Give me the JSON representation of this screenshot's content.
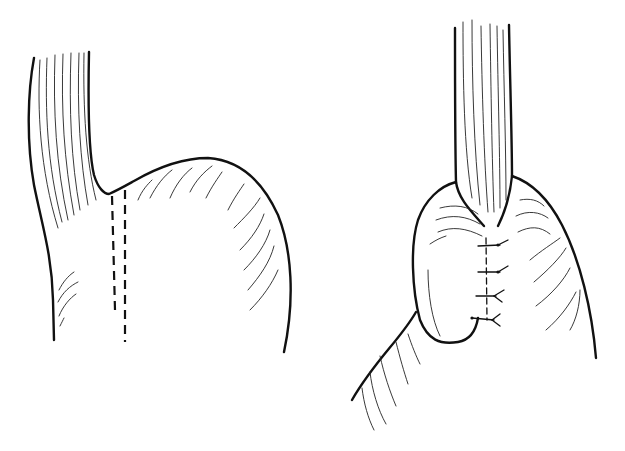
{
  "figure": {
    "panels": [
      {
        "id": "left",
        "depicts": "esophagus and stomach fundus with dashed incision lines"
      },
      {
        "id": "right",
        "depicts": "esophagus with gastric fundus wrapped and sutured"
      }
    ],
    "sutures_count": 4,
    "colors": {
      "line": "#111111",
      "background": "#ffffff"
    }
  }
}
